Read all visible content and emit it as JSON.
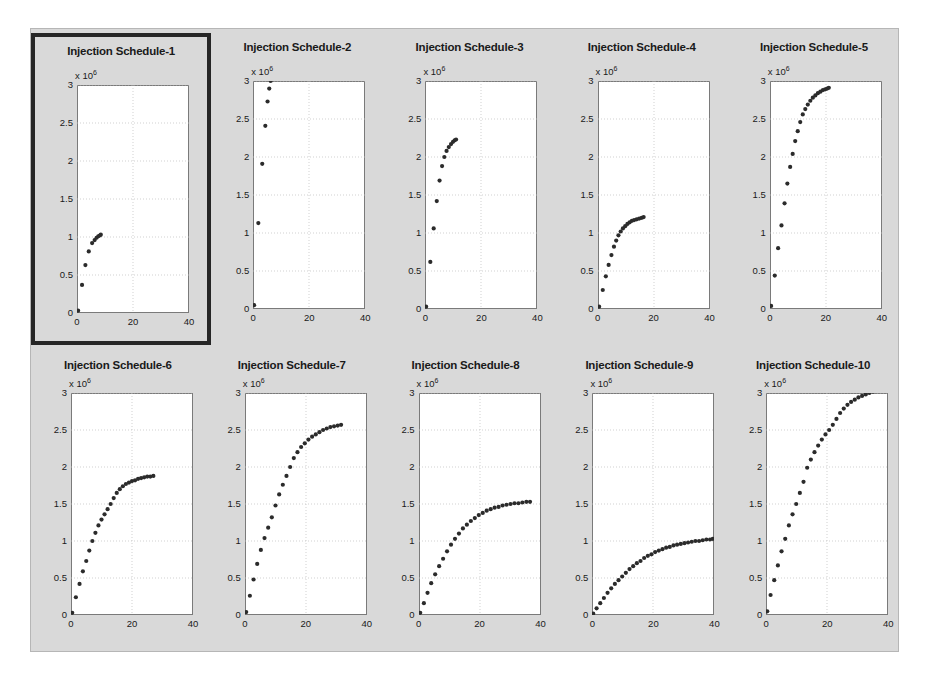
{
  "figure": {
    "row_label": "Base Case",
    "background_color": "#d9d9d9",
    "axes_background_color": "#ffffff",
    "marker_color": "#2b2b2b",
    "selected_panel_index": 0,
    "selection_border_color": "#262626"
  },
  "axis_common": {
    "exponent_label": "x 10",
    "exponent_power": "6",
    "ytick_labels": [
      "0",
      "0.5",
      "1",
      "1.5",
      "2",
      "2.5",
      "3"
    ],
    "ytick_values": [
      0,
      0.5,
      1,
      1.5,
      2,
      2.5,
      3
    ],
    "xtick_labels": [
      "0",
      "20",
      "40"
    ],
    "xtick_values": [
      0,
      20,
      40
    ],
    "xlim": [
      0,
      40
    ],
    "ylim": [
      0,
      3
    ],
    "grid": true
  },
  "chart_data": [
    {
      "type": "scatter",
      "title": "Injection Schedule-1",
      "xlabel": "",
      "ylabel": "",
      "xlim": [
        0,
        40
      ],
      "ylim": [
        0,
        3
      ],
      "yscale_multiplier": "x 10^6",
      "grid": true,
      "x": [
        0.4,
        1.8,
        3.0,
        4.2,
        5.4,
        6.3,
        7.0,
        7.6,
        8.1,
        8.5
      ],
      "y": [
        0.03,
        0.37,
        0.63,
        0.81,
        0.92,
        0.96,
        0.99,
        1.01,
        1.02,
        1.03
      ]
    },
    {
      "type": "scatter",
      "title": "Injection Schedule-2",
      "xlabel": "",
      "ylabel": "",
      "xlim": [
        0,
        40
      ],
      "ylim": [
        0,
        3
      ],
      "yscale_multiplier": "x 10^6",
      "grid": true,
      "x": [
        0.4,
        1.9,
        3.3,
        4.4,
        5.2,
        5.8,
        6.3
      ],
      "y": [
        0.05,
        1.13,
        1.91,
        2.41,
        2.73,
        2.9,
        3.0
      ]
    },
    {
      "type": "scatter",
      "title": "Injection Schedule-3",
      "xlabel": "",
      "ylabel": "",
      "xlim": [
        0,
        40
      ],
      "ylim": [
        0,
        3
      ],
      "yscale_multiplier": "x 10^6",
      "grid": true,
      "x": [
        0.4,
        1.9,
        3.1,
        4.2,
        5.2,
        6.1,
        6.9,
        7.7,
        8.5,
        9.3,
        10.0,
        10.6,
        11.1
      ],
      "y": [
        0.03,
        0.62,
        1.06,
        1.42,
        1.69,
        1.88,
        2.0,
        2.08,
        2.13,
        2.17,
        2.2,
        2.22,
        2.23
      ]
    },
    {
      "type": "scatter",
      "title": "Injection Schedule-4",
      "xlabel": "",
      "ylabel": "",
      "xlim": [
        0,
        40
      ],
      "ylim": [
        0,
        3
      ],
      "yscale_multiplier": "x 10^6",
      "grid": true,
      "x": [
        0.4,
        1.7,
        2.8,
        3.8,
        4.8,
        5.7,
        6.5,
        7.3,
        8.1,
        8.9,
        9.7,
        10.5,
        11.3,
        12.1,
        12.9,
        13.8,
        14.7,
        15.6,
        16.3
      ],
      "y": [
        0.03,
        0.25,
        0.43,
        0.58,
        0.71,
        0.82,
        0.9,
        0.97,
        1.02,
        1.06,
        1.09,
        1.12,
        1.14,
        1.16,
        1.17,
        1.18,
        1.19,
        1.2,
        1.21
      ]
    },
    {
      "type": "scatter",
      "title": "Injection Schedule-5",
      "xlabel": "",
      "ylabel": "",
      "xlim": [
        0,
        40
      ],
      "ylim": [
        0,
        3
      ],
      "yscale_multiplier": "x 10^6",
      "grid": true,
      "x": [
        0.4,
        1.7,
        2.9,
        4.1,
        5.2,
        6.2,
        7.2,
        8.1,
        9.0,
        9.9,
        10.8,
        11.7,
        12.6,
        13.5,
        14.4,
        15.3,
        16.2,
        17.1,
        18.0,
        18.9,
        19.7,
        20.4,
        21.0
      ],
      "y": [
        0.04,
        0.44,
        0.8,
        1.1,
        1.39,
        1.65,
        1.87,
        2.04,
        2.21,
        2.34,
        2.46,
        2.56,
        2.63,
        2.69,
        2.74,
        2.78,
        2.81,
        2.84,
        2.86,
        2.88,
        2.89,
        2.9,
        2.91
      ]
    },
    {
      "type": "scatter",
      "title": "Injection Schedule-6",
      "xlabel": "",
      "ylabel": "",
      "xlim": [
        0,
        40
      ],
      "ylim": [
        0,
        3
      ],
      "yscale_multiplier": "x 10^6",
      "grid": true,
      "x": [
        0.4,
        1.6,
        2.8,
        3.9,
        5.0,
        6.0,
        7.0,
        8.0,
        9.0,
        10.0,
        11.0,
        12.0,
        13.0,
        14.0,
        15.0,
        16.0,
        17.0,
        18.0,
        19.0,
        20.0,
        21.0,
        22.0,
        23.0,
        24.0,
        25.0,
        26.0,
        27.0
      ],
      "y": [
        0.03,
        0.24,
        0.42,
        0.59,
        0.73,
        0.87,
        1.0,
        1.11,
        1.21,
        1.29,
        1.36,
        1.43,
        1.5,
        1.58,
        1.65,
        1.7,
        1.74,
        1.77,
        1.79,
        1.81,
        1.82,
        1.84,
        1.85,
        1.86,
        1.87,
        1.87,
        1.88
      ]
    },
    {
      "type": "scatter",
      "title": "Injection Schedule-7",
      "xlabel": "",
      "ylabel": "",
      "xlim": [
        0,
        40
      ],
      "ylim": [
        0,
        3
      ],
      "yscale_multiplier": "x 10^6",
      "grid": true,
      "x": [
        0.4,
        1.6,
        2.8,
        4.0,
        5.2,
        6.4,
        7.6,
        8.8,
        10.0,
        11.2,
        12.4,
        13.6,
        14.8,
        16.0,
        17.2,
        18.4,
        19.6,
        20.8,
        22.0,
        23.2,
        24.4,
        25.6,
        26.8,
        28.0,
        29.2,
        30.4,
        31.5
      ],
      "y": [
        0.04,
        0.26,
        0.48,
        0.69,
        0.88,
        1.04,
        1.18,
        1.32,
        1.48,
        1.63,
        1.76,
        1.88,
        2.0,
        2.12,
        2.2,
        2.27,
        2.32,
        2.37,
        2.41,
        2.44,
        2.47,
        2.5,
        2.52,
        2.54,
        2.55,
        2.56,
        2.57
      ]
    },
    {
      "type": "scatter",
      "title": "Injection Schedule-8",
      "xlabel": "",
      "ylabel": "",
      "xlim": [
        0,
        40
      ],
      "ylim": [
        0,
        3
      ],
      "yscale_multiplier": "x 10^6",
      "grid": true,
      "x": [
        0.4,
        1.6,
        2.8,
        4.0,
        5.3,
        6.6,
        7.9,
        9.2,
        10.5,
        11.8,
        13.1,
        14.4,
        15.7,
        17.0,
        18.3,
        19.6,
        20.9,
        22.2,
        23.5,
        24.8,
        26.1,
        27.4,
        28.7,
        30.0,
        31.3,
        32.6,
        33.9,
        35.2,
        36.4
      ],
      "y": [
        0.03,
        0.16,
        0.3,
        0.43,
        0.55,
        0.66,
        0.76,
        0.86,
        0.95,
        1.03,
        1.1,
        1.17,
        1.22,
        1.27,
        1.31,
        1.35,
        1.38,
        1.41,
        1.43,
        1.45,
        1.46,
        1.48,
        1.49,
        1.5,
        1.51,
        1.51,
        1.52,
        1.53,
        1.53
      ]
    },
    {
      "type": "scatter",
      "title": "Injection Schedule-9",
      "xlabel": "",
      "ylabel": "",
      "xlim": [
        0,
        40
      ],
      "ylim": [
        0,
        3
      ],
      "yscale_multiplier": "x 10^6",
      "grid": true,
      "x": [
        0.4,
        1.5,
        2.7,
        3.9,
        5.1,
        6.3,
        7.5,
        8.7,
        9.9,
        11.1,
        12.3,
        13.5,
        14.7,
        15.9,
        17.1,
        18.3,
        19.5,
        20.7,
        21.9,
        23.1,
        24.3,
        25.5,
        26.7,
        27.9,
        29.1,
        30.3,
        31.5,
        32.7,
        33.9,
        35.1,
        36.3,
        37.5,
        38.7,
        39.6
      ],
      "y": [
        0.02,
        0.09,
        0.16,
        0.23,
        0.3,
        0.36,
        0.42,
        0.47,
        0.52,
        0.57,
        0.62,
        0.66,
        0.7,
        0.73,
        0.77,
        0.8,
        0.82,
        0.85,
        0.87,
        0.89,
        0.91,
        0.92,
        0.94,
        0.95,
        0.96,
        0.97,
        0.98,
        0.99,
        1.0,
        1.0,
        1.01,
        1.02,
        1.02,
        1.03
      ]
    },
    {
      "type": "scatter",
      "title": "Injection Schedule-10",
      "xlabel": "",
      "ylabel": "",
      "xlim": [
        0,
        40
      ],
      "ylim": [
        0,
        3
      ],
      "yscale_multiplier": "x 10^6",
      "grid": true,
      "x": [
        0.4,
        1.5,
        2.7,
        3.9,
        5.1,
        6.3,
        7.5,
        8.7,
        9.9,
        11.1,
        12.3,
        13.5,
        14.7,
        15.9,
        17.1,
        18.3,
        19.5,
        20.7,
        21.9,
        23.1,
        24.3,
        25.5,
        26.7,
        27.9,
        29.1,
        30.3,
        31.5,
        32.7,
        33.9,
        35.1,
        36.3,
        37.5,
        38.4,
        39.2
      ],
      "y": [
        0.05,
        0.27,
        0.47,
        0.67,
        0.86,
        1.03,
        1.21,
        1.36,
        1.5,
        1.65,
        1.8,
        1.99,
        2.1,
        2.2,
        2.29,
        2.37,
        2.44,
        2.5,
        2.57,
        2.65,
        2.73,
        2.79,
        2.84,
        2.88,
        2.91,
        2.94,
        2.96,
        2.98,
        3.0,
        3.02,
        3.04,
        3.05,
        3.06,
        3.08
      ]
    }
  ]
}
